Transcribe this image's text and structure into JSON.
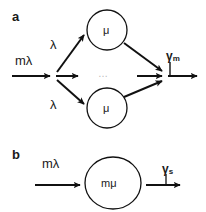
{
  "figure": {
    "background_color": "#ffffff",
    "stroke_color": "#111111",
    "text_color": "#1a1a1a",
    "ellipsis_color": "#b9b9b9"
  },
  "panels": [
    {
      "id": "a",
      "letter": "a",
      "input_label": "mλ",
      "branch_labels": [
        "λ",
        "λ"
      ],
      "nodes": [
        {
          "id": "top",
          "label": "μ"
        },
        {
          "id": "bottom",
          "label": "μ"
        }
      ],
      "ellipsis": "…",
      "output_label": "γ",
      "output_subscript": "m"
    },
    {
      "id": "b",
      "letter": "b",
      "input_label": "mλ",
      "nodes": [
        {
          "id": "single",
          "label": "mμ"
        }
      ],
      "output_label": "γ",
      "output_subscript": "s"
    }
  ]
}
